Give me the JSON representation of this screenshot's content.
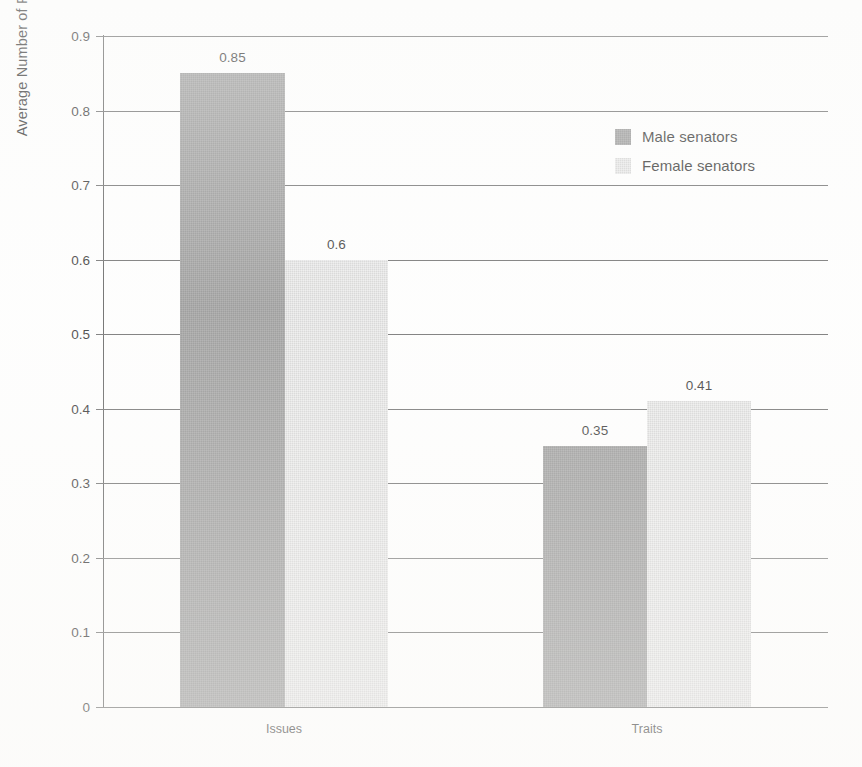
{
  "chart_data": {
    "type": "bar",
    "title": "",
    "subtitle": "",
    "xlabel": "",
    "ylabel": "Average Number of Paragraphs Per Article",
    "categories": [
      "Issues",
      "Traits"
    ],
    "series": [
      {
        "name": "Male senators",
        "values": [
          0.85,
          0.35
        ],
        "color": "#808080"
      },
      {
        "name": "Female senators",
        "values": [
          0.6,
          0.41
        ],
        "color": "#cdcdcd"
      }
    ],
    "value_labels": [
      [
        "0.85",
        "0.6"
      ],
      [
        "0.35",
        "0.41"
      ]
    ],
    "ylim": [
      0,
      0.9
    ],
    "ytick_values": [
      0,
      0.1,
      0.2,
      0.3,
      0.4,
      0.5,
      0.6,
      0.7,
      0.8,
      0.9
    ],
    "ytick_labels": [
      "0",
      "0.1",
      "0.2",
      "0.3",
      "0.4",
      "0.5",
      "0.6",
      "0.7",
      "0.8",
      "0.9"
    ],
    "grid": "horizontal",
    "legend_position": "inside-upper-right",
    "bar_gap": "none-within-group"
  },
  "axis": {
    "y_title": "Average Number of Paragraphs Per Article"
  },
  "legend": {
    "items": [
      {
        "label": "Male senators",
        "swatch": "dark-gray-swatch"
      },
      {
        "label": "Female senators",
        "swatch": "light-gray-swatch"
      }
    ]
  }
}
